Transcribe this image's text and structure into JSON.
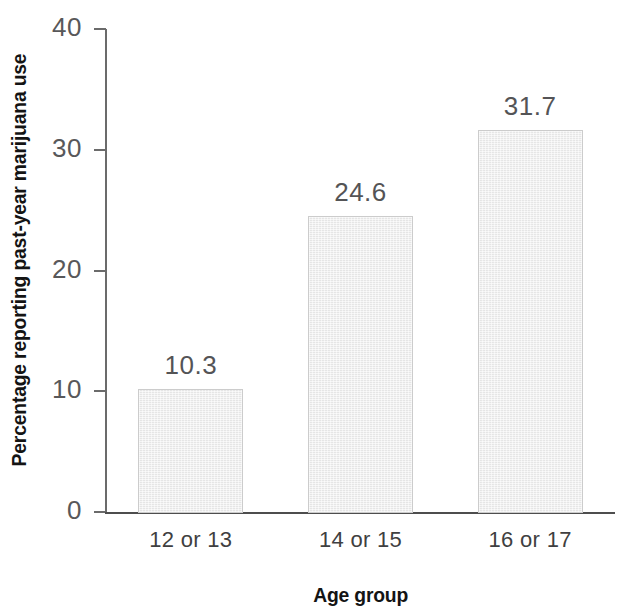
{
  "chart_data": {
    "type": "bar",
    "title": "",
    "categories": [
      "12 or 13",
      "14 or 15",
      "16 or 17"
    ],
    "values": [
      10.3,
      24.6,
      31.7
    ],
    "value_labels": [
      "10.3",
      "24.6",
      "31.7"
    ],
    "xlabel": "Age group",
    "ylabel": "Percentage reporting past-year marijuana use",
    "ylim": [
      0,
      40
    ],
    "yticks": [
      0,
      10,
      20,
      30,
      40
    ],
    "ytick_labels": [
      "0",
      "10",
      "20",
      "30",
      "40"
    ],
    "grid": false,
    "legend": false,
    "bar_fill_color": "#ececec",
    "bar_border_color": "#cccccc",
    "axis_color": "#4e4e4e",
    "label_color": "#545456"
  },
  "axes": {
    "y_title": "Percentage reporting past-year marijuana use",
    "x_title": "Age group"
  },
  "ticks": {
    "y": [
      {
        "label": "40",
        "value": 40
      },
      {
        "label": "30",
        "value": 30
      },
      {
        "label": "20",
        "value": 20
      },
      {
        "label": "10",
        "value": 10
      },
      {
        "label": "0",
        "value": 0
      }
    ]
  },
  "bars": [
    {
      "category": "12 or 13",
      "value": 10.3,
      "label": "10.3"
    },
    {
      "category": "14 or 15",
      "value": 24.6,
      "label": "24.6"
    },
    {
      "category": "16 or 17",
      "value": 31.7,
      "label": "31.7"
    }
  ]
}
